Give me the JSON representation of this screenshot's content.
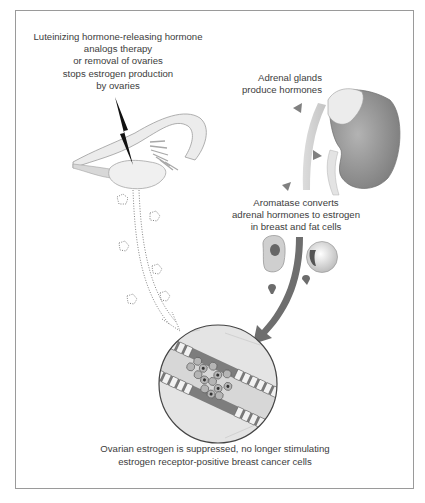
{
  "figure": {
    "labels": {
      "lhrh_therapy": [
        "Luteinizing hormone-releasing hormone",
        "analogs therapy",
        "or removal of ovaries",
        "stops estrogen production",
        "by ovaries"
      ],
      "adrenal": [
        "Adrenal glands",
        "produce hormones"
      ],
      "aromatase": [
        "Aromatase converts",
        "adrenal hormones to estrogen",
        "in breast and fat cells"
      ],
      "result": [
        "Ovarian estrogen is suppressed, no longer stimulating",
        "estrogen receptor-positive breast cancer cells"
      ]
    },
    "elements": {
      "ovary": "ovary-and-fallopian-tube-illustration",
      "blocked_signal": "lightning-bolt-icon",
      "kidney": "kidney-with-adrenal-gland-illustration",
      "hormone_markers": "triangle-hormone-icons",
      "cells": [
        "breast-cell",
        "fat-cell"
      ],
      "tissue_view": "magnified-breast-duct-with-cancer-cells",
      "ovarian_estrogen_path": "dotted-arrow-suppressed",
      "adrenal_estrogen_path": "solid-arrow-active"
    },
    "colors": {
      "frame": "#9a9a9a",
      "organ_light": "#e6e6e6",
      "kidney": "#8f8f8f",
      "arrow_solid": "#6e6e6e",
      "text": "#3d3d3d"
    }
  }
}
